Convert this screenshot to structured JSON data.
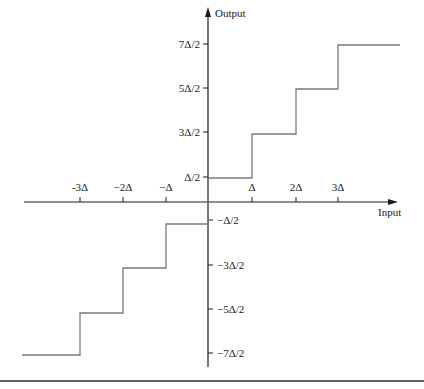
{
  "diagram": {
    "type": "staircase-quantizer-transfer",
    "axes": {
      "x_label": "Input",
      "y_label": "Output",
      "x_ticks": [
        {
          "label": "-3Δ",
          "value": -3
        },
        {
          "label": "−2Δ",
          "value": -2
        },
        {
          "label": "−Δ",
          "value": -1
        },
        {
          "label": "Δ",
          "value": 1
        },
        {
          "label": "2Δ",
          "value": 2
        },
        {
          "label": "3Δ",
          "value": 3
        }
      ],
      "y_ticks": [
        {
          "label": "7Δ/2",
          "value": 3.5
        },
        {
          "label": "5Δ/2",
          "value": 2.5
        },
        {
          "label": "3Δ/2",
          "value": 1.5
        },
        {
          "label": "Δ/2",
          "value": 0.5
        },
        {
          "label": "−Δ/2",
          "value": -0.5
        },
        {
          "label": "−3Δ/2",
          "value": -1.5
        },
        {
          "label": "−5Δ/2",
          "value": -2.5
        },
        {
          "label": "−7Δ/2",
          "value": -3.5
        }
      ]
    },
    "steps": [
      {
        "x_from": -4.3,
        "x_to": -3,
        "y": -3.5
      },
      {
        "x_from": -3,
        "x_to": -2,
        "y": -2.5
      },
      {
        "x_from": -2,
        "x_to": -1,
        "y": -1.5
      },
      {
        "x_from": -1,
        "x_to": 0,
        "y": -0.5
      },
      {
        "x_from": 0,
        "x_to": 1,
        "y": 0.5
      },
      {
        "x_from": 1,
        "x_to": 2,
        "y": 1.5
      },
      {
        "x_from": 2,
        "x_to": 3,
        "y": 2.5
      },
      {
        "x_from": 3,
        "x_to": 4.3,
        "y": 3.5
      }
    ],
    "colors": {
      "axis": "#1a1a1a",
      "curve": "#7a7a7a",
      "rule": "#333333"
    }
  }
}
